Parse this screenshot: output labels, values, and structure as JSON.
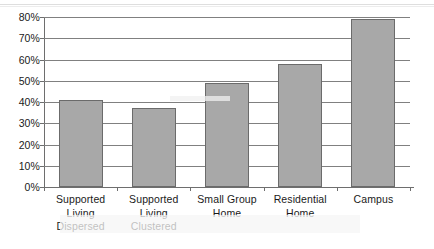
{
  "chart_data": {
    "type": "bar",
    "title": "",
    "xlabel": "",
    "ylabel": "",
    "categories": [
      "Supported Living Dispersed",
      "Supported Living Clustered",
      "Small Group Home",
      "Residential Home",
      "Campus"
    ],
    "category_lines": [
      [
        "Supported",
        "Living",
        "Dispersed"
      ],
      [
        "Supported",
        "Living",
        "Clustered"
      ],
      [
        "Small Group",
        "Home"
      ],
      [
        "Residential",
        "Home"
      ],
      [
        "Campus"
      ]
    ],
    "values": [
      41,
      37,
      49,
      58,
      79
    ],
    "value_labels": [
      "41%",
      "37%",
      "49%",
      "58%",
      "79%"
    ],
    "ylim": [
      0,
      80
    ],
    "y_ticks": [
      0,
      10,
      20,
      30,
      40,
      50,
      60,
      70,
      80
    ],
    "y_tick_labels": [
      "0%",
      "10%",
      "20%",
      "30%",
      "40%",
      "50%",
      "60%",
      "70%",
      "80%"
    ],
    "grid": true,
    "legend": false,
    "legend_position": "none",
    "colors": {
      "bar_fill": "#a8a8a8",
      "bar_border": "#6b6b6b",
      "gridline": "#808080",
      "axis": "#6e6e6e",
      "text": "#1a1a1a",
      "background": "#ffffff"
    }
  }
}
